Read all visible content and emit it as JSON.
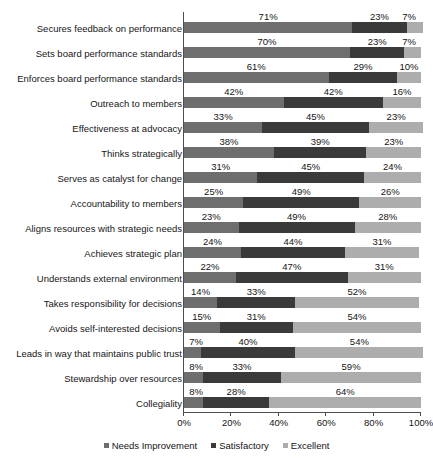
{
  "chart_data": {
    "type": "bar",
    "orientation": "horizontal",
    "stacked": true,
    "stack_mode": "percent",
    "title": "",
    "xlabel": "",
    "ylabel": "",
    "xlim": [
      0,
      100
    ],
    "xticks": [
      "0%",
      "20%",
      "40%",
      "60%",
      "80%",
      "100%"
    ],
    "xtick_values": [
      0,
      20,
      40,
      60,
      80,
      100
    ],
    "grid": false,
    "legend_position": "bottom",
    "value_suffix": "%",
    "categories": [
      "Secures feedback on performance",
      "Sets board performance standards",
      "Enforces board performance standards",
      "Outreach to members",
      "Effectiveness at advocacy",
      "Thinks strategically",
      "Serves as catalyst for change",
      "Accountability to members",
      "Aligns resources with strategic needs",
      "Achieves strategic plan",
      "Understands external environment",
      "Takes responsibility for decisions",
      "Avoids self-interested decisions",
      "Leads in way that maintains public trust",
      "Stewardship over resources",
      "Collegiality"
    ],
    "series": [
      {
        "name": "Needs Improvement",
        "color": "#6e6e6e",
        "values": [
          71,
          70,
          61,
          42,
          33,
          38,
          31,
          25,
          23,
          24,
          22,
          14,
          15,
          7,
          8,
          8
        ]
      },
      {
        "name": "Satisfactory",
        "color": "#3a3a3a",
        "values": [
          23,
          23,
          29,
          42,
          45,
          39,
          45,
          49,
          49,
          44,
          47,
          33,
          31,
          40,
          33,
          28
        ]
      },
      {
        "name": "Excellent",
        "color": "#adadad",
        "values": [
          7,
          7,
          10,
          16,
          23,
          23,
          24,
          26,
          28,
          31,
          31,
          52,
          54,
          54,
          59,
          64
        ]
      }
    ],
    "data_labels": [
      [
        "71%",
        "23%",
        "7%"
      ],
      [
        "70%",
        "23%",
        "7%"
      ],
      [
        "61%",
        "29%",
        "10%"
      ],
      [
        "42%",
        "42%",
        "16%"
      ],
      [
        "33%",
        "45%",
        "23%"
      ],
      [
        "38%",
        "39%",
        "23%"
      ],
      [
        "31%",
        "45%",
        "24%"
      ],
      [
        "25%",
        "49%",
        "26%"
      ],
      [
        "23%",
        "49%",
        "28%"
      ],
      [
        "24%",
        "44%",
        "31%"
      ],
      [
        "22%",
        "47%",
        "31%"
      ],
      [
        "14%",
        "33%",
        "52%"
      ],
      [
        "15%",
        "31%",
        "54%"
      ],
      [
        "7%",
        "40%",
        "54%"
      ],
      [
        "8%",
        "33%",
        "59%"
      ],
      [
        "8%",
        "28%",
        "64%"
      ]
    ]
  },
  "legend": {
    "items": [
      {
        "label": "Needs Improvement",
        "color": "#6e6e6e"
      },
      {
        "label": "Satisfactory",
        "color": "#3a3a3a"
      },
      {
        "label": "Excellent",
        "color": "#adadad"
      }
    ]
  },
  "title_remnant": ""
}
